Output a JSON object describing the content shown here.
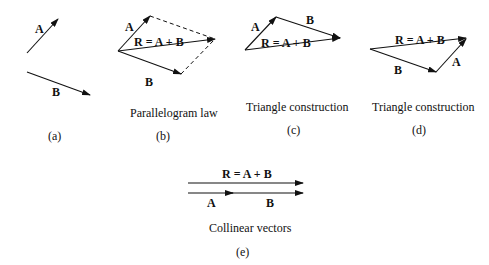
{
  "panels": [
    {
      "id": "a",
      "tag": "(a)",
      "caption": "",
      "labels": {
        "A": "A",
        "B": "B"
      }
    },
    {
      "id": "b",
      "tag": "(b)",
      "caption": "Parallelogram law",
      "labels": {
        "A": "A",
        "B": "B",
        "R": "R = A + B"
      }
    },
    {
      "id": "c",
      "tag": "(c)",
      "caption": "Triangle construction",
      "labels": {
        "A": "A",
        "B": "B",
        "R": "R = A + B"
      }
    },
    {
      "id": "d",
      "tag": "(d)",
      "caption": "Triangle construction",
      "labels": {
        "A": "A",
        "B": "B",
        "R": "R = A + B"
      }
    },
    {
      "id": "e",
      "tag": "(e)",
      "caption": "Collinear vectors",
      "labels": {
        "A": "A",
        "B": "B",
        "R": "R = A + B"
      }
    }
  ],
  "colors": {
    "ink": "#111111",
    "background": "#ffffff"
  }
}
